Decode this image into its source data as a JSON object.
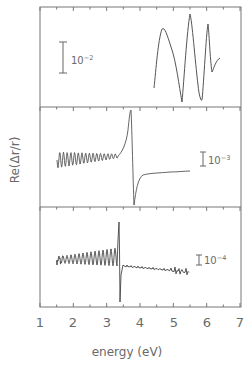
{
  "chart_data": {
    "type": "line",
    "layout": "three vertically stacked panels sharing x-axis",
    "xlabel": "energy (eV)",
    "ylabel": "Re(Δr/r)",
    "xlim": [
      1,
      7
    ],
    "xticks": [
      "1",
      "2",
      "3",
      "4",
      "5",
      "6",
      "7"
    ],
    "grid": false,
    "legend": null,
    "panels": [
      {
        "name": "top",
        "scale_bar": "10⁻²",
        "scale_bar_value": 0.01,
        "series": [
          {
            "name": "top-panel-spectrum",
            "x": [
              4.45,
              4.55,
              4.7,
              4.9,
              5.05,
              5.15,
              5.25,
              5.35,
              5.5,
              5.6,
              5.7,
              5.8,
              5.85,
              5.95,
              6.05
            ],
            "y_rel": [
              -0.5,
              1.2,
              0.9,
              0.2,
              -1.6,
              -0.2,
              1.6,
              0.4,
              -1.5,
              -0.2,
              1.3,
              0.0,
              0.0,
              -0.3,
              0.1
            ]
          }
        ]
      },
      {
        "name": "middle",
        "scale_bar": "10⁻³",
        "scale_bar_value": 0.001,
        "series": [
          {
            "name": "middle-panel-spectrum",
            "x": [
              1.55,
              3.2,
              3.4,
              3.55,
              3.65,
              4.0,
              5.5
            ],
            "y_rel": [
              0.0,
              0.2,
              3.6,
              -3.2,
              -1.0,
              -0.7,
              -0.6
            ],
            "note": "Fabry-Perot-like oscillation 1.55-3.2 eV with decreasing amplitude; sharp derivative feature at ~3.4 eV"
          }
        ]
      },
      {
        "name": "bottom",
        "scale_bar": "10⁻⁴",
        "scale_bar_value": 0.0001,
        "series": [
          {
            "name": "bottom-panel-spectrum",
            "x": [
              1.55,
              3.2,
              3.38,
              3.42,
              3.5,
              4.0,
              5.5
            ],
            "y_rel": [
              0.0,
              0.3,
              3.5,
              -4.5,
              -0.7,
              -0.7,
              -1.3
            ],
            "note": "oscillations growing toward ~3.3 eV; sharp feature at ~3.4 eV; noisy tail to 5.5 eV"
          }
        ]
      }
    ]
  },
  "axes": {
    "xlabel": "energy (eV)",
    "ylabel": "Re(Δr/r)",
    "xticks": [
      "1",
      "2",
      "3",
      "4",
      "5",
      "6",
      "7"
    ]
  },
  "panels": {
    "top": {
      "scale": "10",
      "exp": "−2"
    },
    "middle": {
      "scale": "10",
      "exp": "−3"
    },
    "bottom": {
      "scale": "10",
      "exp": "−4"
    }
  }
}
